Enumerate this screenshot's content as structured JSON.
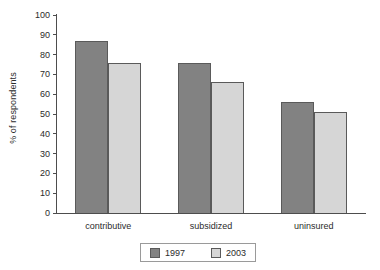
{
  "chart_data": {
    "type": "bar",
    "title": "",
    "subtitle": "",
    "xlabel": "",
    "ylabel": "% of respondents",
    "categories": [
      "contributive",
      "subsidized",
      "uninsured"
    ],
    "series": [
      {
        "name": "1997",
        "color": "#828282",
        "values": [
          87,
          76,
          56
        ]
      },
      {
        "name": "2003",
        "color": "#d6d6d6",
        "values": [
          76,
          66,
          51
        ]
      }
    ],
    "ylim": [
      0,
      100
    ],
    "y_ticks": [
      0,
      10,
      20,
      30,
      40,
      50,
      60,
      70,
      80,
      90,
      100
    ],
    "y_tick_labels": [
      "0",
      "10",
      "20",
      "30",
      "40",
      "50",
      "60",
      "70",
      "80",
      "90",
      "100"
    ],
    "grid": false,
    "legend_position": "bottom",
    "annotations": []
  },
  "legend": {
    "entries": [
      {
        "label": "1997"
      },
      {
        "label": "2003"
      }
    ]
  },
  "colors": {
    "series_1997": "#828282",
    "series_2003": "#d6d6d6",
    "axis": "#4d4d4d",
    "bar_border": "#5a5a5a",
    "text": "#2b2b2b",
    "legend_border": "#9a9a9a",
    "background": "#ffffff"
  }
}
